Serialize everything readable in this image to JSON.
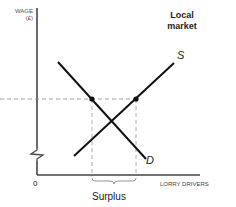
{
  "diagram": {
    "title_line1": "Local",
    "title_line2": "market",
    "y_axis_label_line1": "WAGE",
    "y_axis_label_line2": "(£)",
    "x_axis_label": "LORRY DRIVERS",
    "origin_label": "0",
    "supply_label": "S",
    "demand_label": "D",
    "bracket_label": "Surplus",
    "colors": {
      "lines": "#111111",
      "axes": "#444444",
      "dashed": "#888888"
    }
  }
}
